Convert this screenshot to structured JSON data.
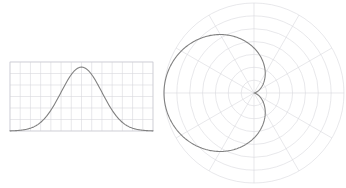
{
  "figure": {
    "background_color": "#ffffff",
    "width": 346,
    "height": 188,
    "panel_count": 2
  },
  "style": {
    "curve_color": "#808080",
    "curve_width": 1.1,
    "grid_color": "#d8d8de",
    "grid_width": 0.6,
    "axis_color": "#c8c8d0"
  },
  "chart_data": [
    {
      "id": "gaussian-bell-curve",
      "type": "line",
      "title": "",
      "subtitle": "",
      "xlabel": "",
      "ylabel": "",
      "grid": true,
      "legend": false,
      "legend_position": "none",
      "xlim": [
        -3.5,
        3.5
      ],
      "ylim": [
        0,
        1.08
      ],
      "xticks": [
        -3.5,
        -3.0,
        -2.5,
        -2.0,
        -1.5,
        -1.0,
        -0.5,
        0.0,
        0.5,
        1.0,
        1.5,
        2.0,
        2.5,
        3.0,
        3.5
      ],
      "yticks": [
        0.0,
        0.18,
        0.36,
        0.54,
        0.72,
        0.9,
        1.08
      ],
      "xticklabels": [],
      "yticklabels": [],
      "series": [
        {
          "name": "gaussian",
          "expression": "y = exp(-x^2 / 2)",
          "x": [
            -3.5,
            -3.25,
            -3.0,
            -2.75,
            -2.5,
            -2.25,
            -2.0,
            -1.75,
            -1.5,
            -1.25,
            -1.0,
            -0.75,
            -0.5,
            -0.25,
            0.0,
            0.25,
            0.5,
            0.75,
            1.0,
            1.25,
            1.5,
            1.75,
            2.0,
            2.25,
            2.5,
            2.75,
            3.0,
            3.25,
            3.5
          ],
          "y": [
            0.0022,
            0.0051,
            0.0111,
            0.0228,
            0.0439,
            0.0796,
            0.1353,
            0.2163,
            0.3247,
            0.4578,
            0.6065,
            0.7548,
            0.8825,
            0.9692,
            1.0,
            0.9692,
            0.8825,
            0.7548,
            0.6065,
            0.4578,
            0.3247,
            0.2163,
            0.1353,
            0.0796,
            0.0439,
            0.0228,
            0.0111,
            0.0051,
            0.0022
          ]
        }
      ],
      "annotations": []
    },
    {
      "id": "polar-cardioid",
      "type": "line",
      "projection": "polar",
      "title": "",
      "subtitle": "",
      "xlabel": "",
      "ylabel": "",
      "grid": true,
      "legend": false,
      "legend_position": "none",
      "rlim": [
        0,
        2.0
      ],
      "rticks": [
        0.2857,
        0.5714,
        0.8571,
        1.1429,
        1.4286,
        1.7143,
        2.0
      ],
      "rticklabels": [],
      "thetaticks_deg": [
        0,
        30,
        60,
        90,
        120,
        150,
        180,
        210,
        240,
        270,
        300,
        330
      ],
      "thetaticklabels": [],
      "theta_direction": "counterclockwise",
      "theta_zero_location": "E",
      "series": [
        {
          "name": "cardioid",
          "expression": "r = 1 - cos(theta)",
          "theta_deg": [
            0,
            10,
            20,
            30,
            40,
            50,
            60,
            70,
            80,
            90,
            100,
            110,
            120,
            130,
            140,
            150,
            160,
            170,
            180,
            190,
            200,
            210,
            220,
            230,
            240,
            250,
            260,
            270,
            280,
            290,
            300,
            310,
            320,
            330,
            340,
            350,
            360
          ],
          "r": [
            0.0,
            0.0152,
            0.0603,
            0.134,
            0.234,
            0.3572,
            0.5,
            0.658,
            0.8264,
            1.0,
            1.1736,
            1.342,
            1.5,
            1.6428,
            1.766,
            1.866,
            1.9397,
            1.9848,
            2.0,
            1.9848,
            1.9397,
            1.866,
            1.766,
            1.6428,
            1.5,
            1.342,
            1.1736,
            1.0,
            0.8264,
            0.658,
            0.5,
            0.3572,
            0.234,
            0.134,
            0.0603,
            0.0152,
            0.0
          ]
        }
      ],
      "annotations": []
    }
  ]
}
